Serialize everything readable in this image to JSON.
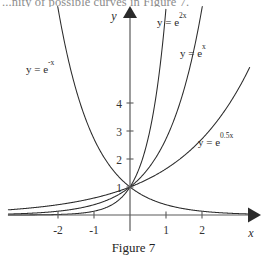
{
  "page": {
    "background_color": "#ffffff",
    "ink_color": "#2b2b2b",
    "clipped_body_text": "...nity of possible curves in Figure 7."
  },
  "caption": {
    "text": "Figure 7"
  },
  "axes": {
    "x_axis_label": "x",
    "y_axis_label": "y",
    "x_ticks": [
      "-2",
      "-1",
      "1",
      "2"
    ],
    "y_ticks": [
      "1",
      "2",
      "3",
      "4"
    ],
    "x_tick_values": [
      -2,
      -1,
      1,
      2
    ],
    "y_tick_values": [
      1,
      2,
      3,
      4
    ],
    "origin_px": {
      "x": 130,
      "y": 215
    },
    "unit_px": {
      "x": 36,
      "y": 28
    },
    "x_axis_start_px": 8,
    "x_axis_end_px": 248,
    "y_axis_top_px": 18
  },
  "curve_labels": [
    {
      "id": "label-e-neg-x",
      "base": "y = e",
      "exponent": "-x",
      "x": 26,
      "y": 73
    },
    {
      "id": "label-e-2x",
      "base": "y = e",
      "exponent": "2x",
      "x": 157,
      "y": 26
    },
    {
      "id": "label-e-x",
      "base": "y = e",
      "exponent": "x",
      "x": 180,
      "y": 57
    },
    {
      "id": "label-e-05x",
      "base": "y = e",
      "exponent": "0.5x",
      "x": 198,
      "y": 146
    }
  ],
  "chart_data": {
    "type": "line",
    "title": "Figure 7",
    "xlabel": "x",
    "ylabel": "y",
    "xlim": [
      -3.4,
      3.3
    ],
    "ylim": [
      -0.4,
      7.2
    ],
    "grid": false,
    "legend": "inline-annotations",
    "x_ticks": [
      -2,
      -1,
      1,
      2
    ],
    "y_ticks": [
      1,
      2,
      3,
      4
    ],
    "common_point": {
      "x": 0,
      "y": 1
    },
    "series": [
      {
        "name": "y = e^-x",
        "expression": "exp(-x)",
        "rate": -1,
        "label": "y = e^-x",
        "x": [
          -3.4,
          -3.0,
          -2.5,
          -2.0,
          -1.5,
          -1.0,
          -0.5,
          0.0,
          0.5,
          1.0,
          1.5,
          2.0,
          2.5,
          3.0,
          3.3
        ],
        "y": [
          29.96,
          20.09,
          12.18,
          7.39,
          4.48,
          2.72,
          1.65,
          1.0,
          0.61,
          0.37,
          0.22,
          0.14,
          0.08,
          0.05,
          0.04
        ]
      },
      {
        "name": "y = e^2x",
        "expression": "exp(2x)",
        "rate": 2,
        "label": "y = e^2x",
        "x": [
          -3.4,
          -3.0,
          -2.5,
          -2.0,
          -1.5,
          -1.0,
          -0.5,
          0.0,
          0.5,
          1.0,
          1.5
        ],
        "y": [
          0.0011,
          0.0025,
          0.0067,
          0.018,
          0.05,
          0.135,
          0.368,
          1.0,
          2.718,
          7.389,
          20.09
        ]
      },
      {
        "name": "y = e^x",
        "expression": "exp(x)",
        "rate": 1,
        "label": "y = e^x",
        "x": [
          -3.4,
          -3.0,
          -2.5,
          -2.0,
          -1.5,
          -1.0,
          -0.5,
          0.0,
          0.5,
          1.0,
          1.5,
          2.0
        ],
        "y": [
          0.033,
          0.05,
          0.082,
          0.135,
          0.223,
          0.368,
          0.607,
          1.0,
          1.649,
          2.718,
          4.482,
          7.389
        ]
      },
      {
        "name": "y = e^0.5x",
        "expression": "exp(0.5x)",
        "rate": 0.5,
        "label": "y = e^0.5x",
        "x": [
          -3.4,
          -3.0,
          -2.5,
          -2.0,
          -1.5,
          -1.0,
          -0.5,
          0.0,
          0.5,
          1.0,
          1.5,
          2.0,
          2.5,
          3.0,
          3.3
        ],
        "y": [
          0.183,
          0.223,
          0.287,
          0.368,
          0.472,
          0.607,
          0.779,
          1.0,
          1.284,
          1.649,
          2.117,
          2.718,
          3.49,
          4.482,
          5.21
        ]
      }
    ]
  }
}
